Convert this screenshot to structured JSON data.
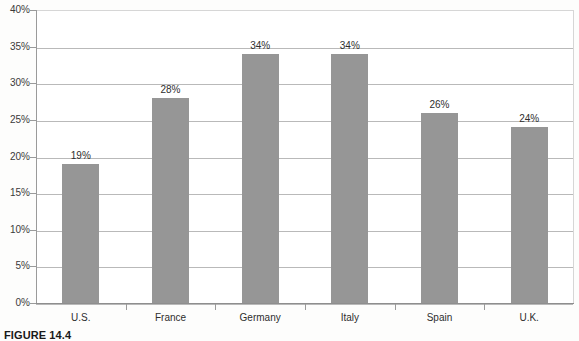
{
  "figure": {
    "caption": "FIGURE 14.4"
  },
  "chart_data": {
    "type": "bar",
    "title": "",
    "xlabel": "",
    "ylabel": "",
    "categories": [
      "U.S.",
      "France",
      "Germany",
      "Italy",
      "Spain",
      "U.K."
    ],
    "values": [
      19,
      28,
      34,
      34,
      26,
      24
    ],
    "value_labels": [
      "19%",
      "28%",
      "34%",
      "34%",
      "26%",
      "24%"
    ],
    "ylim": [
      0,
      40
    ],
    "ytick_values": [
      0,
      5,
      10,
      15,
      20,
      25,
      30,
      35,
      40
    ],
    "ytick_labels": [
      "0%",
      "5%",
      "10%",
      "15%",
      "20%",
      "25%",
      "30%",
      "35%",
      "40%"
    ],
    "grid": true,
    "legend": null,
    "bar_color": "#969696",
    "gridline_color": "#b9b9b9",
    "axis_color": "#9a9a9a",
    "plot_background": "#ffffff"
  }
}
